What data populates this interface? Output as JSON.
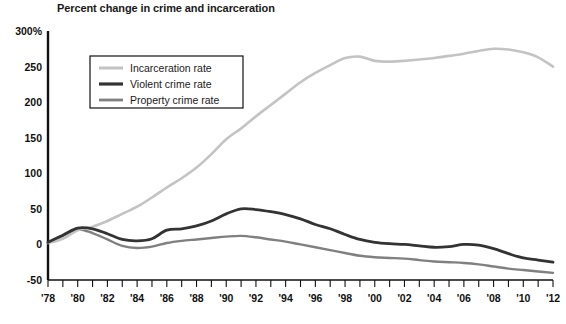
{
  "chart_data": {
    "type": "line",
    "title": "Percent change in crime and incarceration",
    "xlabel": "",
    "ylabel": "",
    "ylim": [
      -50,
      300
    ],
    "xlim": [
      1978,
      2012
    ],
    "grid": false,
    "legend_position": "upper-left-inside",
    "y_ticks": [
      "300%",
      "250",
      "200",
      "150",
      "100",
      "50",
      "0",
      "-50"
    ],
    "y_tick_values": [
      300,
      250,
      200,
      150,
      100,
      50,
      0,
      -50
    ],
    "x_ticks": [
      "'78",
      "'80",
      "'82",
      "'84",
      "'86",
      "'88",
      "'90",
      "'92",
      "'94",
      "'96",
      "'98",
      "'00",
      "'02",
      "'04",
      "'06",
      "'08",
      "'10",
      "'12"
    ],
    "x_tick_values": [
      1978,
      1980,
      1982,
      1984,
      1986,
      1988,
      1990,
      1992,
      1994,
      1996,
      1998,
      2000,
      2002,
      2004,
      2006,
      2008,
      2010,
      2012
    ],
    "x_minor_tick_interval": 1,
    "x": [
      1978,
      1979,
      1980,
      1981,
      1982,
      1983,
      1984,
      1985,
      1986,
      1987,
      1988,
      1989,
      1990,
      1991,
      1992,
      1993,
      1994,
      1995,
      1996,
      1997,
      1998,
      1999,
      2000,
      2001,
      2002,
      2003,
      2004,
      2005,
      2006,
      2007,
      2008,
      2009,
      2010,
      2011,
      2012
    ],
    "series": [
      {
        "name": "Incarceration rate",
        "color": "#c3c3c3",
        "width": 2.6,
        "values": [
          2,
          8,
          20,
          25,
          33,
          43,
          53,
          66,
          80,
          93,
          108,
          127,
          148,
          163,
          180,
          196,
          212,
          228,
          241,
          252,
          262,
          264,
          258,
          257,
          258,
          260,
          262,
          265,
          268,
          272,
          275,
          274,
          270,
          263,
          250
        ]
      },
      {
        "name": "Violent crime rate",
        "color": "#333333",
        "width": 2.8,
        "values": [
          3,
          13,
          23,
          22,
          15,
          7,
          5,
          8,
          20,
          22,
          26,
          33,
          43,
          50,
          49,
          46,
          42,
          36,
          28,
          22,
          14,
          7,
          3,
          1,
          0,
          -2,
          -4,
          -3,
          0,
          -1,
          -6,
          -13,
          -19,
          -22,
          -25
        ]
      },
      {
        "name": "Property crime rate",
        "color": "#808080",
        "width": 2.4,
        "values": [
          2,
          12,
          21,
          16,
          7,
          -2,
          -5,
          -3,
          2,
          5,
          7,
          9,
          11,
          12,
          10,
          7,
          4,
          0,
          -4,
          -8,
          -12,
          -16,
          -18,
          -19,
          -20,
          -22,
          -24,
          -25,
          -26,
          -28,
          -31,
          -34,
          -36,
          -38,
          -40
        ]
      }
    ]
  },
  "legend": {
    "items": [
      {
        "label": "Incarceration rate"
      },
      {
        "label": "Violent crime rate"
      },
      {
        "label": "Property crime rate"
      }
    ]
  }
}
